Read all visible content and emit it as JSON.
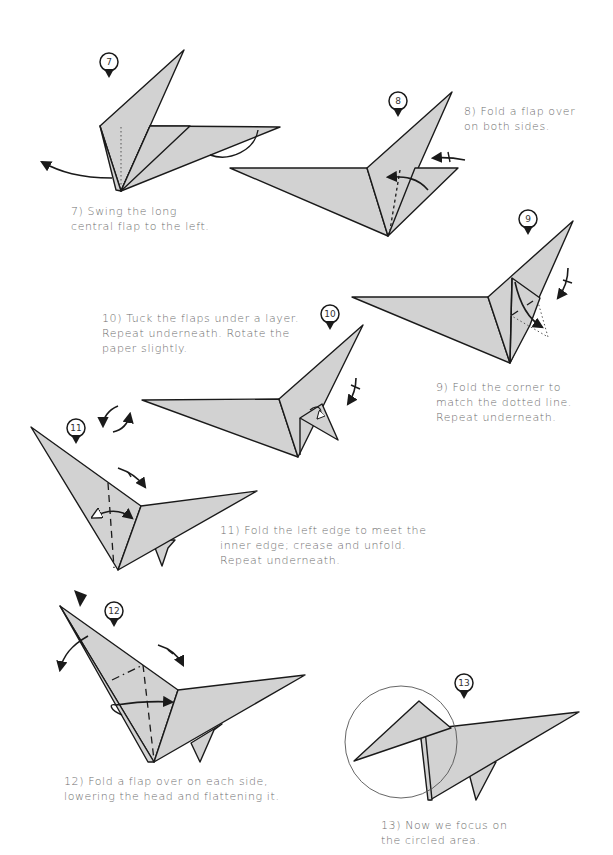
{
  "steps": [
    {
      "number": "7",
      "caption": "7) Swing the long\ncentral flap to the left."
    },
    {
      "number": "8",
      "caption": "8) Fold a flap over\non both sides."
    },
    {
      "number": "9",
      "caption": "9) Fold the corner to\nmatch the dotted line.\nRepeat underneath."
    },
    {
      "number": "10",
      "caption": "10) Tuck the flaps under a layer.\nRepeat underneath. Rotate the\npaper slightly."
    },
    {
      "number": "11",
      "caption": "11) Fold the left edge to meet the\ninner edge; crease and unfold.\nRepeat underneath."
    },
    {
      "number": "12",
      "caption": "12) Fold a flap over on each side,\nlowering the head and flattening it."
    },
    {
      "number": "13",
      "caption": "13) Now we focus on\nthe circled area."
    }
  ],
  "colors": {
    "paper": "#d2d2d2",
    "line": "#1a1a1a",
    "caption": "#6e6e6e"
  }
}
